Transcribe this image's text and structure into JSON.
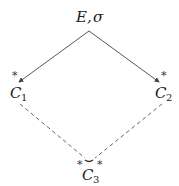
{
  "diagram": {
    "top_node": {
      "label": "E,",
      "sigma": "σ"
    },
    "left_node": {
      "letter": "C",
      "sub": "1",
      "star": "*"
    },
    "right_node": {
      "letter": "C",
      "sub": "2",
      "star": "*"
    },
    "bottom_node": {
      "letter": "C",
      "sub": "3",
      "star_left": "*",
      "star_right": "*"
    },
    "edges": [
      {
        "from": "E,σ",
        "to": "C1",
        "style": "solid-arrow"
      },
      {
        "from": "E,σ",
        "to": "C2",
        "style": "solid-arrow"
      },
      {
        "from": "C1",
        "to": "C3",
        "style": "dashed"
      },
      {
        "from": "C2",
        "to": "C3",
        "style": "dashed"
      }
    ],
    "colors": {
      "line": "#444444",
      "text": "#222222"
    }
  }
}
